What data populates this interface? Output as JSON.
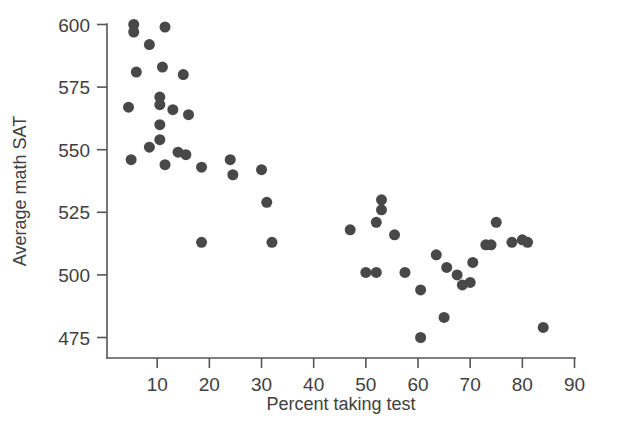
{
  "chart_data": {
    "type": "scatter",
    "title": "",
    "xlabel": "Percent taking test",
    "ylabel": "Average math SAT",
    "xlim": [
      2.5,
      90
    ],
    "ylim": [
      468,
      604
    ],
    "grid": false,
    "legend": null,
    "xticks": [
      10,
      20,
      30,
      40,
      50,
      60,
      70,
      80,
      90
    ],
    "xtick_labels": [
      "10",
      "20",
      "30",
      "40",
      "50",
      "60",
      "70",
      "80",
      "90"
    ],
    "yticks": [
      475,
      500,
      525,
      550,
      575,
      600
    ],
    "ytick_labels": [
      "475",
      "500",
      "525",
      "550",
      "575",
      "600"
    ],
    "marker": {
      "shape": "circle",
      "color": "#484848",
      "size_px": 11
    },
    "points": [
      {
        "x": 5.5,
        "y": 600
      },
      {
        "x": 5.5,
        "y": 597
      },
      {
        "x": 11.5,
        "y": 599
      },
      {
        "x": 8.5,
        "y": 592
      },
      {
        "x": 11.0,
        "y": 583
      },
      {
        "x": 6.0,
        "y": 581
      },
      {
        "x": 15.0,
        "y": 580
      },
      {
        "x": 10.5,
        "y": 571
      },
      {
        "x": 10.5,
        "y": 568
      },
      {
        "x": 4.5,
        "y": 567
      },
      {
        "x": 13.0,
        "y": 566
      },
      {
        "x": 16.0,
        "y": 564
      },
      {
        "x": 10.5,
        "y": 560
      },
      {
        "x": 10.5,
        "y": 554
      },
      {
        "x": 8.5,
        "y": 551
      },
      {
        "x": 14.0,
        "y": 549
      },
      {
        "x": 15.5,
        "y": 548
      },
      {
        "x": 5.0,
        "y": 546
      },
      {
        "x": 11.5,
        "y": 544
      },
      {
        "x": 18.5,
        "y": 543
      },
      {
        "x": 24.0,
        "y": 546
      },
      {
        "x": 24.5,
        "y": 540
      },
      {
        "x": 30.0,
        "y": 542
      },
      {
        "x": 31.0,
        "y": 529
      },
      {
        "x": 18.5,
        "y": 513
      },
      {
        "x": 32.0,
        "y": 513
      },
      {
        "x": 53.0,
        "y": 530
      },
      {
        "x": 53.0,
        "y": 526
      },
      {
        "x": 52.0,
        "y": 521
      },
      {
        "x": 47.0,
        "y": 518
      },
      {
        "x": 55.5,
        "y": 516
      },
      {
        "x": 50.0,
        "y": 501
      },
      {
        "x": 52.0,
        "y": 501
      },
      {
        "x": 57.5,
        "y": 501
      },
      {
        "x": 60.5,
        "y": 494
      },
      {
        "x": 63.5,
        "y": 508
      },
      {
        "x": 65.5,
        "y": 503
      },
      {
        "x": 67.5,
        "y": 500
      },
      {
        "x": 68.5,
        "y": 496
      },
      {
        "x": 70.0,
        "y": 497
      },
      {
        "x": 70.5,
        "y": 505
      },
      {
        "x": 73.0,
        "y": 512
      },
      {
        "x": 74.0,
        "y": 512
      },
      {
        "x": 75.0,
        "y": 521
      },
      {
        "x": 78.0,
        "y": 513
      },
      {
        "x": 80.0,
        "y": 514
      },
      {
        "x": 81.0,
        "y": 513
      },
      {
        "x": 65.0,
        "y": 483
      },
      {
        "x": 60.5,
        "y": 475
      },
      {
        "x": 84.0,
        "y": 479
      }
    ]
  }
}
